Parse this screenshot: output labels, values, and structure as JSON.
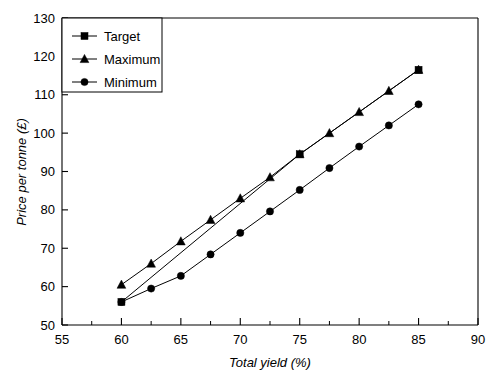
{
  "chart_data": {
    "type": "line",
    "title": "",
    "xlabel": "Total yield (%)",
    "ylabel": "Price per tonne (£)",
    "xlim": [
      55,
      90
    ],
    "ylim": [
      50,
      130
    ],
    "xticks": [
      55,
      60,
      65,
      70,
      75,
      80,
      85,
      90
    ],
    "xtick_labels": [
      "55",
      "60",
      "65",
      "70",
      "75",
      "80",
      "85",
      "90"
    ],
    "xminor_ticks": [
      57.5,
      62.5,
      67.5,
      72.5,
      77.5,
      82.5,
      87.5
    ],
    "yticks": [
      50,
      60,
      70,
      80,
      90,
      100,
      110,
      120,
      130
    ],
    "ytick_labels": [
      "50",
      "60",
      "70",
      "80",
      "90",
      "100",
      "110",
      "120",
      "130"
    ],
    "grid": false,
    "legend_position": "top-left",
    "series": [
      {
        "name": "Target",
        "marker": "square",
        "x": [
          60,
          75,
          85
        ],
        "values": [
          56,
          94.5,
          116.5
        ]
      },
      {
        "name": "Maximum",
        "marker": "triangle",
        "x": [
          60,
          62.5,
          65,
          67.5,
          70,
          72.5,
          75,
          77.5,
          80,
          82.5,
          85
        ],
        "values": [
          60.5,
          66,
          71.8,
          77.4,
          83,
          88.5,
          94.5,
          100,
          105.5,
          111,
          116.5
        ]
      },
      {
        "name": "Minimum",
        "marker": "circle",
        "x": [
          60,
          62.5,
          65,
          67.5,
          70,
          72.5,
          75,
          77.5,
          80,
          82.5,
          85
        ],
        "values": [
          56,
          59.5,
          62.8,
          68.4,
          74,
          79.6,
          85.2,
          90.9,
          96.5,
          102,
          107.5
        ]
      }
    ]
  },
  "legend": {
    "entries": [
      {
        "label": "Target"
      },
      {
        "label": "Maximum"
      },
      {
        "label": "Minimum"
      }
    ]
  },
  "colors": {
    "axis": "#000000",
    "series": "#000000",
    "background": "#ffffff"
  }
}
